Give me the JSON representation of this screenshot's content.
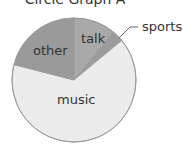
{
  "chart_data": {
    "type": "pie",
    "title": "Circle Graph A",
    "categories": [
      "talk",
      "sports",
      "music",
      "other"
    ],
    "values": [
      11,
      3,
      65,
      21
    ],
    "colors": [
      "#a9a9a9",
      "#9c9c9c",
      "#ececec",
      "#9a9a9a"
    ],
    "start_angle_deg": 0,
    "direction": "clockwise",
    "outline_color": "#9a9a9a",
    "legend": "none",
    "labels": [
      {
        "text": "talk",
        "placement": "inside"
      },
      {
        "text": "sports",
        "placement": "outside-with-leader"
      },
      {
        "text": "music",
        "placement": "inside"
      },
      {
        "text": "other",
        "placement": "inside"
      }
    ]
  }
}
